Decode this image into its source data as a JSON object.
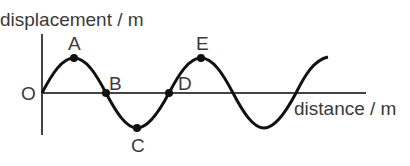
{
  "diagram": {
    "y_axis_label": "displacement / m",
    "x_axis_label": "distance / m",
    "origin_label": "O",
    "points": [
      {
        "label": "A",
        "description": "crest"
      },
      {
        "label": "B",
        "description": "equilibrium crossing"
      },
      {
        "label": "C",
        "description": "trough"
      },
      {
        "label": "D",
        "description": "equilibrium crossing"
      },
      {
        "label": "E",
        "description": "crest"
      }
    ],
    "wave": {
      "type": "sine",
      "cycles_shown": 2.25
    }
  }
}
